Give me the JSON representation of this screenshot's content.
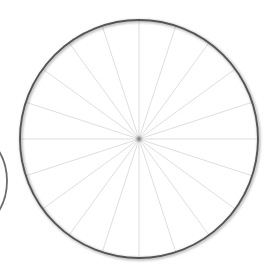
{
  "scene": {
    "title": "Spoked wheel diagram",
    "background_color": "#ffffff",
    "width": 275,
    "height": 280
  },
  "chart_data": {
    "type": "pie",
    "title": "Spoked wheel diagram",
    "subtitle": "",
    "xlabel": "",
    "ylabel": "",
    "legend_position": "none",
    "grid": false,
    "categories": [
      "0°",
      "18°",
      "36°",
      "54°",
      "72°",
      "90°",
      "108°",
      "126°",
      "144°",
      "162°",
      "180°",
      "198°",
      "216°",
      "234°",
      "252°",
      "270°",
      "288°",
      "306°",
      "324°",
      "342°"
    ],
    "values": [
      5,
      5,
      5,
      5,
      5,
      5,
      5,
      5,
      5,
      5,
      5,
      5,
      5,
      5,
      5,
      5,
      5,
      5,
      5,
      5
    ],
    "slice_count": 20,
    "slice_angle_degrees": 18,
    "spoke_count": 20,
    "annotations": [
      "Equal 18° sectors",
      "All spokes converge at the hub"
    ]
  },
  "main_wheel": {
    "name": "Main wheel",
    "center_x": 139,
    "center_y": 139,
    "radius": 119,
    "rim_color": "#555555",
    "rim_width": 1.9,
    "spoke_color": "#d6d6d6",
    "spoke_width": 0.8,
    "spoke_count": 20,
    "spoke_angle_step": 18,
    "spoke_start_angle": 0,
    "hub_radius": 2.4,
    "hub_color": "#7a7a7a",
    "fill_color": "#ffffff",
    "halo_color": "#e8e8e8"
  },
  "partial_wheel": {
    "name": "Cropped neighbouring wheel",
    "center_x": -52,
    "center_y": 181,
    "radius": 59,
    "rim_color": "#6b6b6b",
    "rim_width": 1.8,
    "visible_top_y": 158,
    "visible_bottom_y": 205,
    "visible_right_x": 7
  }
}
